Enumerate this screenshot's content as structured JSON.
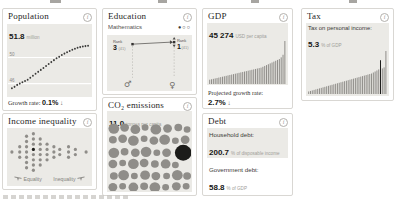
{
  "ui": {
    "info_glyph": "i",
    "colors": {
      "chart_bg": "#ebeae6",
      "bar_gray": "#8f8d89",
      "highlight": "#1c1c1a",
      "grid_white": "#ffffff"
    }
  },
  "cards": {
    "population": {
      "title": "Population",
      "value": "51.8",
      "unit": "million",
      "growth_label": "Growth rate:",
      "growth_value": "0.1%",
      "growth_arrow": "↓"
    },
    "education": {
      "title": "Education",
      "subject": "Mathematics",
      "pagination": "●○○"
    },
    "gdp": {
      "title": "GDP",
      "value": "45 274",
      "unit": "USD per capita",
      "proj_label": "Projected growth rate:",
      "proj_value": "2.7%",
      "proj_arrow": "↓"
    },
    "tax": {
      "title": "Tax",
      "label": "Tax on personal income:",
      "value": "5.3",
      "unit": "% of GDP"
    },
    "inequality": {
      "title": "Income inequality",
      "left_label": "Equality",
      "right_label": "Inequality"
    },
    "co2": {
      "title": "CO₂ emissions",
      "value": "11.0",
      "unit": "tonnes per capita"
    },
    "debt": {
      "title": "Debt",
      "hh_label": "Household debt:",
      "hh_value": "200.7",
      "hh_unit": "% of disposable income",
      "gov_label": "Government debt:",
      "gov_value": "58.8",
      "gov_unit": "% of GDP"
    }
  },
  "chart_data": [
    {
      "id": "population-trend",
      "type": "line",
      "style": "dotted",
      "title": "Population, million",
      "ylabel": "million",
      "ylim": [
        44.6,
        52.8
      ],
      "ticks": [
        50,
        46
      ],
      "values": [
        45.3,
        45.5,
        45.8,
        46.0,
        46.2,
        46.4,
        46.6,
        46.9,
        47.2,
        47.5,
        47.8,
        48.1,
        48.4,
        48.7,
        49.0,
        49.3,
        49.6,
        49.9,
        50.1,
        50.4,
        50.6,
        50.8,
        51.0,
        51.2,
        51.35,
        51.5,
        51.6,
        51.7,
        51.75,
        51.8
      ]
    },
    {
      "id": "education-rank",
      "type": "rank",
      "title": "Mathematics rank (PISA), boys vs girls",
      "rank_label": "Rank",
      "groups": [
        {
          "name": "boys",
          "symbol": "♂",
          "rank": "3",
          "total": "(41)",
          "x_frac": 0.3,
          "marker_y": 9
        },
        {
          "name": "girls",
          "symbol": "♀",
          "rank": "1",
          "total": "(41)",
          "x_frac": 0.79,
          "marker_y": 7
        }
      ]
    },
    {
      "id": "gdp-bars",
      "type": "bar",
      "title": "GDP, USD per capita, countries sorted ascending",
      "highlight_index": null,
      "values": [
        5,
        5.5,
        6,
        6.5,
        7,
        7.5,
        8,
        8.5,
        9,
        9.5,
        10,
        10.5,
        11,
        11.5,
        12,
        12.5,
        13,
        13.5,
        14,
        14.5,
        15,
        15.5,
        16,
        16.5,
        17,
        17.5,
        18,
        18.5,
        19,
        20,
        21,
        22,
        23,
        24,
        25,
        26,
        27,
        28,
        29,
        31,
        34,
        50
      ]
    },
    {
      "id": "tax-bars",
      "type": "bar",
      "title": "Tax on personal income, % of GDP, countries sorted ascending",
      "highlight_index": 40,
      "values": [
        2.5,
        3,
        3.5,
        4,
        4.5,
        5,
        5.5,
        6,
        6.5,
        7,
        7.5,
        8,
        8.5,
        9,
        9.5,
        10,
        10.5,
        11,
        11.5,
        12,
        12.5,
        13,
        13.5,
        14,
        14.5,
        15,
        15.5,
        16,
        16.5,
        17,
        17.5,
        18,
        18.5,
        19,
        19.5,
        20,
        21,
        22,
        23,
        24,
        33,
        25,
        26,
        42
      ]
    },
    {
      "id": "inequality-dots",
      "type": "scatter",
      "title": "Income inequality, distribution of countries",
      "xlabel_left": "Equality",
      "xlabel_right": "Inequality",
      "highlight_index": 14,
      "points": [
        [
          4,
          21
        ],
        [
          12,
          16
        ],
        [
          12,
          21
        ],
        [
          12,
          26
        ],
        [
          19,
          6
        ],
        [
          19,
          11
        ],
        [
          19,
          16
        ],
        [
          19,
          21
        ],
        [
          19,
          26
        ],
        [
          19,
          31
        ],
        [
          19,
          36
        ],
        [
          26,
          3.5
        ],
        [
          26,
          8.5
        ],
        [
          26,
          13.5
        ],
        [
          26,
          18.5
        ],
        [
          26,
          23.5
        ],
        [
          26,
          28.5
        ],
        [
          26,
          33.5
        ],
        [
          26,
          38.5
        ],
        [
          33,
          8.5
        ],
        [
          33,
          13.5
        ],
        [
          33,
          18.5
        ],
        [
          33,
          23.5
        ],
        [
          33,
          28.5
        ],
        [
          33,
          33.5
        ],
        [
          40,
          13.5
        ],
        [
          40,
          18.5
        ],
        [
          40,
          23.5
        ],
        [
          40,
          28.5
        ],
        [
          47,
          16
        ],
        [
          47,
          21
        ],
        [
          47,
          26
        ],
        [
          53,
          18.5
        ],
        [
          53,
          23.5
        ],
        [
          62,
          16
        ],
        [
          62,
          21
        ],
        [
          62,
          26
        ],
        [
          69,
          18.5
        ],
        [
          69,
          23.5
        ],
        [
          80,
          21
        ]
      ]
    },
    {
      "id": "co2-bubbles",
      "type": "bubble",
      "title": "CO2 emissions, tonnes per capita, one bubble per country",
      "highlight_index": 22,
      "bubbles": [
        [
          6,
          7,
          5.5
        ],
        [
          17,
          6,
          4.5
        ],
        [
          28,
          8,
          5
        ],
        [
          38,
          6,
          3.5
        ],
        [
          49,
          8,
          5.5
        ],
        [
          61,
          7,
          4.5
        ],
        [
          72,
          6,
          4
        ],
        [
          81,
          8,
          3.5
        ],
        [
          5,
          19,
          4
        ],
        [
          15,
          18,
          4.5
        ],
        [
          26,
          20,
          5.5
        ],
        [
          37,
          18,
          3.5
        ],
        [
          47,
          20,
          4.5
        ],
        [
          58,
          19,
          5.5
        ],
        [
          69,
          20,
          3.5
        ],
        [
          79,
          19,
          4.5
        ],
        [
          6,
          33,
          5.5
        ],
        [
          17,
          32,
          4
        ],
        [
          28,
          33,
          4.5
        ],
        [
          39,
          32,
          5.5
        ],
        [
          50,
          33,
          3.5
        ],
        [
          60,
          33,
          4.5
        ],
        [
          77,
          33,
          8.5
        ],
        [
          5,
          45,
          4.5
        ],
        [
          15,
          44,
          3.5
        ],
        [
          26,
          45,
          5.5
        ],
        [
          37,
          44,
          4.5
        ],
        [
          48,
          45,
          4
        ],
        [
          59,
          45,
          5
        ],
        [
          69,
          46,
          3.5
        ],
        [
          6,
          58,
          4
        ],
        [
          16,
          57,
          5.5
        ],
        [
          27,
          58,
          3.5
        ],
        [
          38,
          57,
          5
        ],
        [
          49,
          58,
          4.5
        ],
        [
          60,
          58,
          3.5
        ],
        [
          71,
          57,
          5.5
        ],
        [
          81,
          58,
          4
        ],
        [
          5,
          70,
          4.5
        ],
        [
          15,
          69,
          3.5
        ],
        [
          26,
          70,
          5
        ],
        [
          37,
          69,
          4
        ],
        [
          48,
          70,
          5.5
        ],
        [
          59,
          70,
          3.5
        ],
        [
          70,
          69,
          4.5
        ],
        [
          80,
          69,
          3.5
        ]
      ]
    }
  ]
}
